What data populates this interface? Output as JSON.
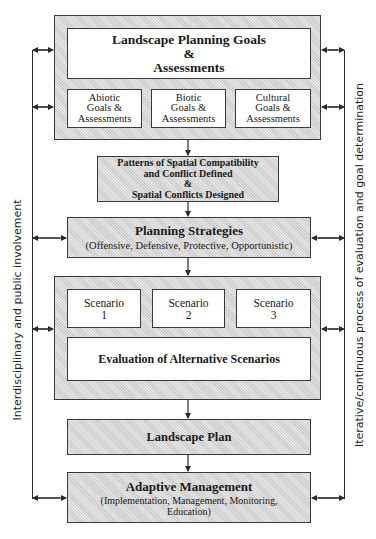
{
  "diagram": {
    "goals_block": {
      "title_line1": "Landscape Planning Goals",
      "title_line2": "&",
      "title_line3": "Assessments",
      "sub_boxes": [
        {
          "line1": "Abiotic",
          "line2": "Goals &",
          "line3": "Assessments"
        },
        {
          "line1": "Biotic",
          "line2": "Goals &",
          "line3": "Assessments"
        },
        {
          "line1": "Cultural",
          "line2": "Goals &",
          "line3": "Assessments"
        }
      ]
    },
    "patterns_box": {
      "line1": "Patterns of Spatial Compatibility",
      "line2": "and Conflict Defined",
      "line3": "&",
      "line4": "Spatial Conflicts Designed"
    },
    "strategies_box": {
      "title": "Planning Strategies",
      "subtitle": "(Offensive, Defensive, Protective, Opportunistic)"
    },
    "scenarios_block": {
      "scenarios": [
        {
          "label": "Scenario",
          "number": "1"
        },
        {
          "label": "Scenario",
          "number": "2"
        },
        {
          "label": "Scenario",
          "number": "3"
        }
      ],
      "evaluation": "Evaluation of Alternative Scenarios"
    },
    "plan_box": {
      "title": "Landscape Plan"
    },
    "management_box": {
      "title": "Adaptive Management",
      "subtitle_line1": "(Implementation, Management, Monitoring,",
      "subtitle_line2": "Education)"
    },
    "side_labels": {
      "left": "Interdisciplinary and public involvement",
      "right": "Iterative/continuous process of evaluation and goal determination"
    },
    "colors": {
      "box_fill": "#d9d9d9",
      "line": "#2a2a2a",
      "inner_fill": "#ffffff"
    }
  }
}
